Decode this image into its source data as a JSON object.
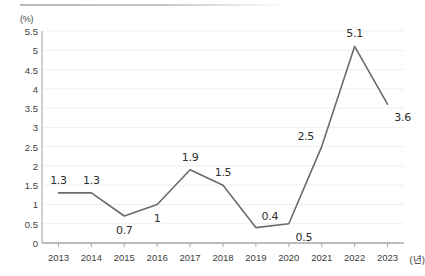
{
  "chart_data": {
    "type": "line",
    "title": "",
    "subtitle": "",
    "xlabel": "(년)",
    "ylabel": "(%)",
    "categories": [
      "2013",
      "2014",
      "2015",
      "2016",
      "2017",
      "2018",
      "2019",
      "2020",
      "2021",
      "2022",
      "2023"
    ],
    "values": [
      1.3,
      1.3,
      0.7,
      1,
      1.9,
      1.5,
      0.4,
      0.5,
      2.5,
      5.1,
      3.6
    ],
    "point_labels": [
      "1.3",
      "1.3",
      "0.7",
      "1",
      "1.9",
      "1.5",
      "0.4",
      "0.5",
      "2.5",
      "5.1",
      "3.6"
    ],
    "label_positions": [
      "above",
      "above",
      "below",
      "below",
      "above",
      "above",
      "above-right",
      "below-right",
      "above-left",
      "above",
      "below-right"
    ],
    "ylim": [
      0,
      5.5
    ],
    "ytick_step": 0.5,
    "yticks": [
      "0",
      "0.5",
      "1",
      "1.5",
      "2",
      "2.5",
      "3",
      "3.5",
      "4",
      "4.5",
      "5",
      "5.5"
    ],
    "grid": true,
    "grid_axis": "y",
    "legend": "none",
    "series_color": "#6b6b6b",
    "grid_color": "#efefef",
    "axis_color": "#a8a8a8",
    "text_color": "#3d3d3d",
    "background": "#ffffff",
    "marker": "none",
    "line_width": 1.6
  }
}
